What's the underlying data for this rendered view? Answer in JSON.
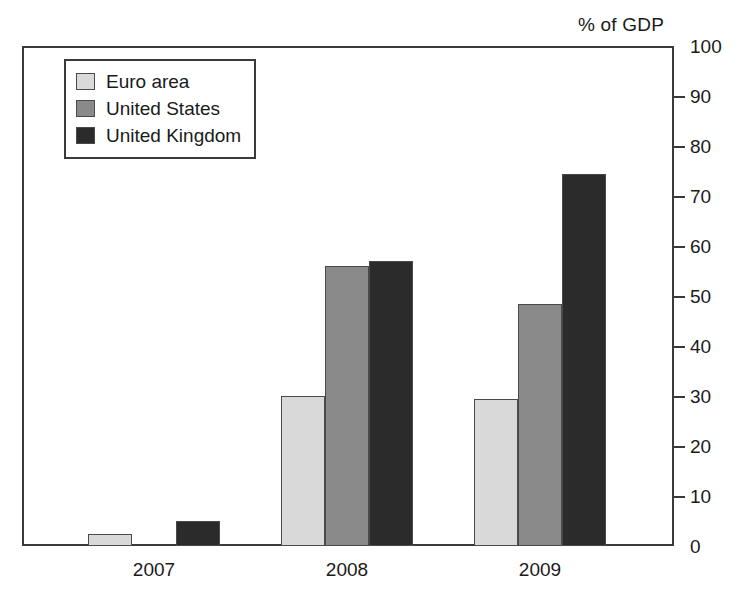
{
  "chart_data": {
    "type": "bar",
    "title": "",
    "xlabel": "",
    "ylabel": "% of GDP",
    "categories": [
      "2007",
      "2008",
      "2009"
    ],
    "series": [
      {
        "name": "Euro area",
        "color": "#d9d9d9",
        "values": [
          2.5,
          30,
          29.5
        ]
      },
      {
        "name": "United States",
        "color": "#8a8a8a",
        "values": [
          0,
          56,
          48.5
        ]
      },
      {
        "name": "United Kingdom",
        "color": "#2b2b2b",
        "values": [
          5,
          57,
          74.5
        ]
      }
    ],
    "ylim": [
      0,
      100
    ],
    "yticks": [
      0,
      10,
      20,
      30,
      40,
      50,
      60,
      70,
      80,
      90,
      100
    ],
    "ytick_labels": [
      "0",
      "10",
      "20",
      "30",
      "40",
      "50",
      "60",
      "70",
      "80",
      "90",
      "100"
    ],
    "y_axis_position": "right",
    "grid": false,
    "legend_position": "upper-left-inside"
  },
  "axis_title": "% of GDP",
  "legend": {
    "items": [
      {
        "label": "Euro area"
      },
      {
        "label": "United States"
      },
      {
        "label": "United Kingdom"
      }
    ]
  }
}
